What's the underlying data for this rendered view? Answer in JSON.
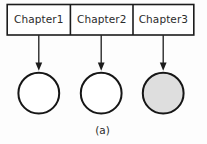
{
  "figure": {
    "caption": "(a)",
    "background_color": "#fdfdfd",
    "line_color": "#1c1c1c",
    "text_color": "#2b2b2b",
    "bar": {
      "fill_color": "#ffffff",
      "cells": [
        {
          "label": "Chapter1"
        },
        {
          "label": "Chapter2"
        },
        {
          "label": "Chapter3"
        }
      ]
    },
    "nodes": [
      {
        "name": "node-1",
        "fill_color": "#ffffff",
        "filled": "false"
      },
      {
        "name": "node-2",
        "fill_color": "#ffffff",
        "filled": "false"
      },
      {
        "name": "node-3",
        "fill_color": "#dedede",
        "filled": "true"
      }
    ],
    "arrows": [
      {
        "name": "arrow-chapter1-to-node1"
      },
      {
        "name": "arrow-chapter2-to-node2"
      },
      {
        "name": "arrow-chapter3-to-node3"
      }
    ]
  }
}
